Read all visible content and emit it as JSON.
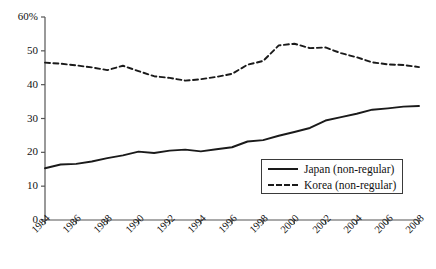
{
  "chart_data": {
    "type": "line",
    "title": "",
    "subtitle": "",
    "xlabel": "",
    "ylabel": "",
    "xlim": [
      1984,
      2008
    ],
    "ylim": [
      0,
      60
    ],
    "grid": false,
    "legend_position": "inside-bottom-right",
    "x": [
      1984,
      1985,
      1986,
      1987,
      1988,
      1989,
      1990,
      1991,
      1992,
      1993,
      1994,
      1995,
      1996,
      1997,
      1998,
      1999,
      2000,
      2001,
      2002,
      2003,
      2004,
      2005,
      2006,
      2007,
      2008
    ],
    "xtick_labels": [
      "1984",
      "1986",
      "1988",
      "1990",
      "1992",
      "1994",
      "1996",
      "1998",
      "2000",
      "2002",
      "2004",
      "2006",
      "2008"
    ],
    "xticks": [
      1984,
      1986,
      1988,
      1990,
      1992,
      1994,
      1996,
      1998,
      2000,
      2002,
      2004,
      2006,
      2008
    ],
    "ytick_labels": [
      "0",
      "10",
      "20",
      "30",
      "40",
      "50",
      "60%"
    ],
    "yticks": [
      0,
      10,
      20,
      30,
      40,
      50,
      60
    ],
    "series": [
      {
        "name": "Japan (non-regular)",
        "style": "solid",
        "color": "#1a1a1a",
        "values": [
          15.3,
          16.4,
          16.6,
          17.3,
          18.3,
          19.1,
          20.2,
          19.8,
          20.5,
          20.8,
          20.3,
          20.9,
          21.5,
          23.2,
          23.6,
          24.9,
          26.0,
          27.2,
          29.4,
          30.4,
          31.4,
          32.6,
          33.0,
          33.5,
          33.7
        ]
      },
      {
        "name": "Korea (non-regular)",
        "style": "dashed",
        "color": "#1a1a1a",
        "values": [
          46.5,
          46.2,
          45.7,
          45.1,
          44.3,
          45.6,
          44.0,
          42.5,
          42.0,
          41.2,
          41.6,
          42.3,
          43.2,
          45.9,
          47.0,
          51.6,
          52.1,
          50.8,
          51.0,
          49.3,
          48.1,
          46.6,
          46.0,
          45.8,
          45.2
        ]
      }
    ]
  },
  "legend": {
    "entries": [
      {
        "label": "Japan (non-regular)",
        "style": "solid"
      },
      {
        "label": "Korea (non-regular)",
        "style": "dashed"
      }
    ]
  }
}
